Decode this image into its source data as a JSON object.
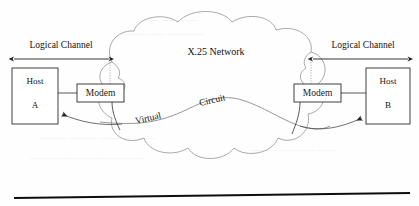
{
  "diagram": {
    "cloud": {
      "label": "X.25 Network",
      "stroke_color": "#9a9a9a"
    },
    "virtual_circuit": {
      "word_1": "Virtual",
      "word_2": "Circuit",
      "stroke_color": "#7d7d7d"
    },
    "channels": [
      {
        "id": "left-logical-channel",
        "label": "Logical Channel"
      },
      {
        "id": "right-logical-channel",
        "label": "Logical Channel"
      }
    ],
    "nodes": [
      {
        "id": "host-a",
        "label_top": "Host",
        "label_bottom": "A"
      },
      {
        "id": "modem-left",
        "label": "Modem"
      },
      {
        "id": "modem-right",
        "label": "Modem"
      },
      {
        "id": "host-b",
        "label_top": "Host",
        "label_bottom": "B"
      }
    ],
    "colors": {
      "page_background": "#fefefe",
      "box_stroke": "#2b2b2b",
      "cloud_stroke": "#9a9a9a",
      "rule": "#0d0d0d"
    }
  }
}
